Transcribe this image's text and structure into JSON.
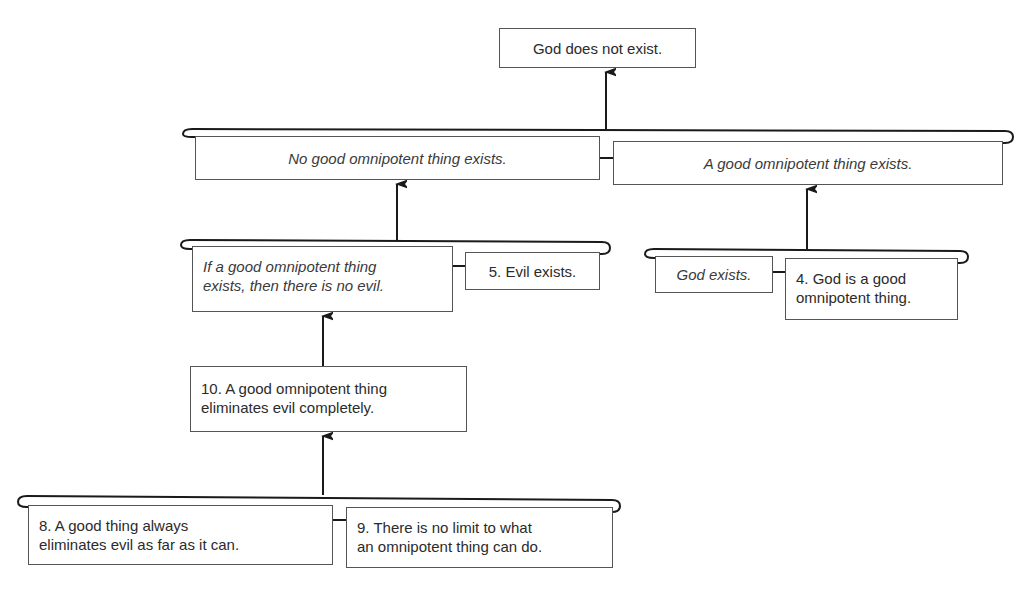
{
  "diagram": {
    "type": "argument-map",
    "conclusion": {
      "id": "conclusion",
      "text": "God does not exist.",
      "style": "normal"
    },
    "premises": {
      "no_good_omnipotent": {
        "text": "No good omnipotent thing exists.",
        "style": "italic"
      },
      "a_good_omnipotent": {
        "text": "A good omnipotent thing exists.",
        "style": "italic"
      },
      "if_good_omnipotent": {
        "lines": [
          "If a good omnipotent thing",
          "exists, then there is no evil."
        ],
        "style": "italic"
      },
      "p5": {
        "text": "5. Evil exists.",
        "style": "normal"
      },
      "god_exists": {
        "text": "God exists.",
        "style": "italic"
      },
      "p4": {
        "lines": [
          "4. God is a good",
          "omnipotent thing."
        ],
        "style": "normal"
      },
      "p10": {
        "lines": [
          "10. A good omnipotent thing",
          "eliminates evil completely."
        ],
        "style": "normal"
      },
      "p8": {
        "lines": [
          "8. A good thing always",
          "eliminates evil as far as it can."
        ],
        "style": "normal"
      },
      "p9": {
        "lines": [
          "9. There is no limit to what",
          "an omnipotent thing can do."
        ],
        "style": "normal"
      }
    },
    "links": [
      {
        "from": [
          "no_good_omnipotent",
          "a_good_omnipotent"
        ],
        "to": "conclusion",
        "kind": "linked"
      },
      {
        "from": [
          "if_good_omnipotent",
          "p5"
        ],
        "to": "no_good_omnipotent",
        "kind": "linked"
      },
      {
        "from": [
          "god_exists",
          "p4"
        ],
        "to": "a_good_omnipotent",
        "kind": "linked"
      },
      {
        "from": [
          "p10"
        ],
        "to": "if_good_omnipotent",
        "kind": "single"
      },
      {
        "from": [
          "p8",
          "p9"
        ],
        "to": "p10",
        "kind": "linked"
      }
    ],
    "colors": {
      "line": "#1a1a1a",
      "box_border": "#555555",
      "text": "#2b2b2b",
      "background": "#ffffff"
    }
  }
}
